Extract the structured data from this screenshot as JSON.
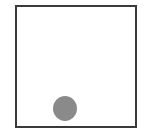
{
  "canvas": {
    "width": 146,
    "height": 133,
    "background_color": "#ffffff",
    "label": ""
  },
  "frame": {
    "name": "bordered-square",
    "border_color": "#3a3a3a",
    "border_width_px": 2.5,
    "fill_color": "#ffffff",
    "x": 15,
    "y": 5,
    "width": 122,
    "height": 123,
    "label": ""
  },
  "shapes": [
    {
      "type": "circle",
      "name": "gray-circle",
      "fill_color": "#8a8a8a",
      "center_x": 48,
      "center_y": 101,
      "diameter": 24,
      "label": ""
    }
  ]
}
